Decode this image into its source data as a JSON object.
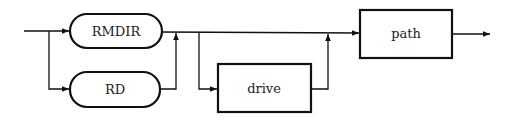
{
  "diagram": {
    "type": "syntax-diagram",
    "command_alternatives": [
      {
        "label": "RMDIR",
        "shape": "rounded"
      },
      {
        "label": "RD",
        "shape": "rounded"
      }
    ],
    "optional_parameter": {
      "label": "drive",
      "shape": "rectangle"
    },
    "required_parameter": {
      "label": "path",
      "shape": "rectangle"
    },
    "colors": {
      "stroke": "#111111",
      "background": "#ffffff",
      "text": "#222222"
    }
  }
}
